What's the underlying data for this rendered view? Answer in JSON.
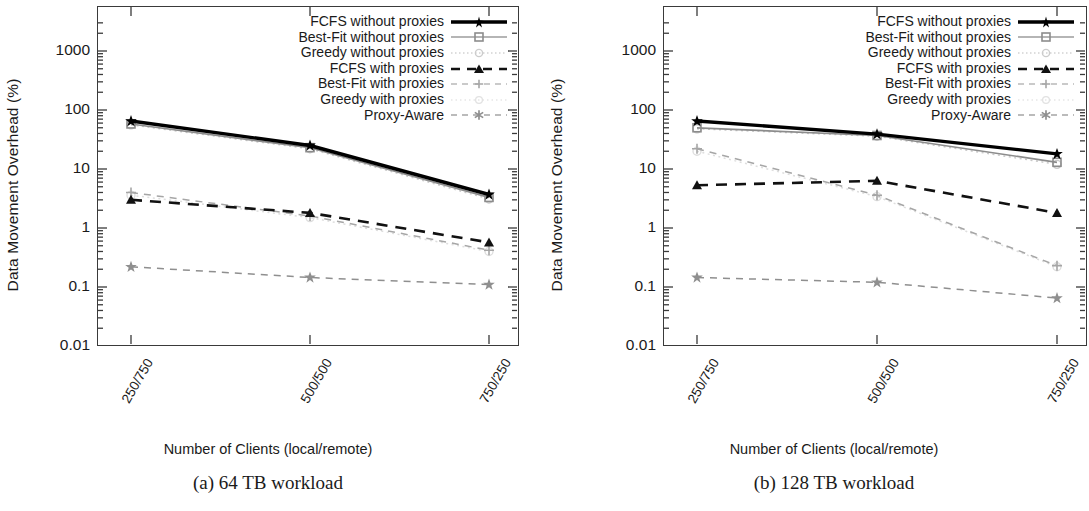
{
  "figure": {
    "panels": [
      {
        "caption": "(a) 64 TB workload",
        "xlabel": "Number of Clients (local/remote)",
        "ylabel": "Data Movement Overhead (%)"
      },
      {
        "caption": "(b) 128 TB workload",
        "xlabel": "Number of Clients (local/remote)",
        "ylabel": "Data Movement Overhead (%)"
      }
    ],
    "y_tick_labels": [
      "1000",
      "100",
      "10",
      "1",
      "0.1",
      "0.01"
    ],
    "x_tick_labels": [
      "250/750",
      "500/500",
      "750/250"
    ],
    "legend_labels": [
      "FCFS without proxies",
      "Best-Fit without proxies",
      "Greedy without proxies",
      "FCFS with proxies",
      "Best-Fit with proxies",
      "Greedy with proxies",
      "Proxy-Aware"
    ],
    "colors": {
      "fcfs_no_proxy": "#000000",
      "bestfit_no_proxy": "#8c8c8c",
      "greedy_no_proxy": "#c9c9c9",
      "fcfs_proxy": "#111111",
      "bestfit_proxy": "#a6a6a6",
      "greedy_proxy": "#dedede",
      "proxy_aware": "#8f8f8f",
      "frame": "#3a3a3a",
      "text": "#1a1a1a"
    }
  },
  "chart_data": [
    {
      "type": "line",
      "title": "(a) 64 TB workload",
      "xlabel": "Number of Clients (local/remote)",
      "ylabel": "Data Movement Overhead (%)",
      "categories": [
        "250/750",
        "500/500",
        "750/250"
      ],
      "yscale": "log",
      "ylim": [
        0.01,
        3000
      ],
      "y_ticks": [
        0.01,
        0.1,
        1,
        10,
        100,
        1000
      ],
      "grid": false,
      "legend_position": "top-right inside",
      "series": [
        {
          "name": "FCFS without proxies",
          "values": [
            65,
            25,
            3.7
          ],
          "style": "solid-thick",
          "marker": "star",
          "color": "#000000"
        },
        {
          "name": "Best-Fit without proxies",
          "values": [
            58,
            23,
            3.3
          ],
          "style": "solid",
          "marker": "square",
          "color": "#8c8c8c"
        },
        {
          "name": "Greedy without proxies",
          "values": [
            56,
            22,
            3.1
          ],
          "style": "dotted",
          "marker": "circle",
          "color": "#c9c9c9"
        },
        {
          "name": "FCFS with proxies",
          "values": [
            3.0,
            1.8,
            0.57
          ],
          "style": "dashed-thick",
          "marker": "triangle",
          "color": "#111111"
        },
        {
          "name": "Best-Fit with proxies",
          "values": [
            4.0,
            1.6,
            0.42
          ],
          "style": "dashed",
          "marker": "plus",
          "color": "#a6a6a6"
        },
        {
          "name": "Greedy with proxies",
          "values": [
            3.6,
            1.5,
            0.4
          ],
          "style": "dotted",
          "marker": "circle",
          "color": "#dedede"
        },
        {
          "name": "Proxy-Aware",
          "values": [
            0.22,
            0.145,
            0.11
          ],
          "style": "dashed",
          "marker": "star",
          "color": "#8f8f8f"
        }
      ]
    },
    {
      "type": "line",
      "title": "(b) 128 TB workload",
      "xlabel": "Number of Clients (local/remote)",
      "ylabel": "Data Movement Overhead (%)",
      "categories": [
        "250/750",
        "500/500",
        "750/250"
      ],
      "yscale": "log",
      "ylim": [
        0.01,
        3000
      ],
      "y_ticks": [
        0.01,
        0.1,
        1,
        10,
        100,
        1000
      ],
      "grid": false,
      "legend_position": "top-right inside",
      "series": [
        {
          "name": "FCFS without proxies",
          "values": [
            65,
            39,
            18
          ],
          "style": "solid-thick",
          "marker": "star",
          "color": "#000000"
        },
        {
          "name": "Best-Fit without proxies",
          "values": [
            50,
            37,
            13
          ],
          "style": "solid",
          "marker": "square",
          "color": "#8c8c8c"
        },
        {
          "name": "Greedy without proxies",
          "values": [
            48,
            36,
            12
          ],
          "style": "dotted",
          "marker": "circle",
          "color": "#c9c9c9"
        },
        {
          "name": "FCFS with proxies",
          "values": [
            5.3,
            6.3,
            1.8
          ],
          "style": "dashed-thick",
          "marker": "triangle",
          "color": "#111111"
        },
        {
          "name": "Best-Fit with proxies",
          "values": [
            22,
            3.6,
            0.23
          ],
          "style": "dashed",
          "marker": "plus",
          "color": "#a6a6a6"
        },
        {
          "name": "Greedy with proxies",
          "values": [
            20,
            3.4,
            0.22
          ],
          "style": "dotted",
          "marker": "circle",
          "color": "#dedede"
        },
        {
          "name": "Proxy-Aware",
          "values": [
            0.145,
            0.12,
            0.065
          ],
          "style": "dashed",
          "marker": "star",
          "color": "#8f8f8f"
        }
      ]
    }
  ]
}
